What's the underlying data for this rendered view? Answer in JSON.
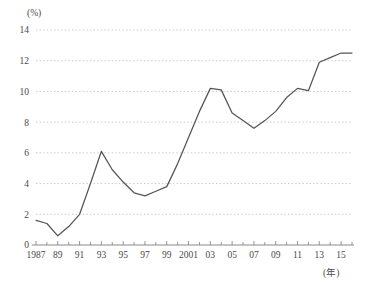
{
  "chart_data": {
    "type": "line",
    "title": "",
    "xlabel": "(年)",
    "ylabel": "(%)",
    "x": [
      1987,
      1988,
      1989,
      1990,
      1991,
      1992,
      1993,
      1994,
      1995,
      1996,
      1997,
      1998,
      1999,
      2000,
      2001,
      2002,
      2003,
      2004,
      2005,
      2006,
      2007,
      2008,
      2009,
      2010,
      2011,
      2012,
      2013,
      2014,
      2015,
      2016
    ],
    "values": [
      1.6,
      1.4,
      0.6,
      1.2,
      2.0,
      4.0,
      6.1,
      4.9,
      4.1,
      3.4,
      3.2,
      3.5,
      3.8,
      5.3,
      7.0,
      8.7,
      10.2,
      10.1,
      8.6,
      8.1,
      7.6,
      8.1,
      8.7,
      9.6,
      10.2,
      10.05,
      11.9,
      12.2,
      12.5,
      12.5
    ],
    "xlim": [
      1987,
      2016
    ],
    "ylim": [
      0,
      14
    ],
    "x_tick_labels": [
      "1987",
      "89",
      "91",
      "93",
      "95",
      "97",
      "99",
      "2001",
      "03",
      "05",
      "07",
      "09",
      "11",
      "13",
      "15"
    ],
    "x_tick_years": [
      1987,
      1989,
      1991,
      1993,
      1995,
      1997,
      1999,
      2001,
      2003,
      2005,
      2007,
      2009,
      2011,
      2013,
      2015
    ],
    "y_tick_labels": [
      "0",
      "2",
      "4",
      "6",
      "8",
      "10",
      "12",
      "14"
    ],
    "y_tick_values": [
      0,
      2,
      4,
      6,
      8,
      10,
      12,
      14
    ],
    "grid": true,
    "legend": "none",
    "series_color": "#555555",
    "grid_color": "#b9b9c9",
    "axis_color": "#7d7d7d"
  }
}
